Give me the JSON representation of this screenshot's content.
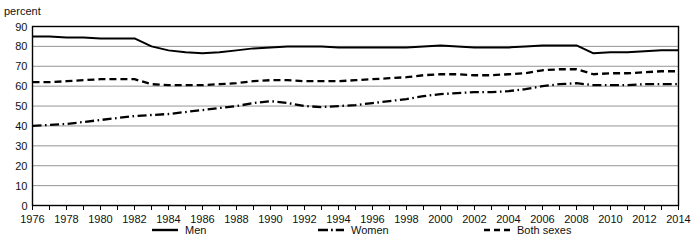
{
  "axis_unit": "percent",
  "legend": {
    "items": [
      {
        "label": "Men",
        "style": "solid"
      },
      {
        "label": "Women",
        "style": "dash-dot"
      },
      {
        "label": "Both sexes",
        "style": "dashed"
      }
    ]
  },
  "chart_data": {
    "type": "line",
    "title": "",
    "subtitle": "",
    "xlabel": "",
    "ylabel": "percent",
    "ylim": [
      0,
      90
    ],
    "xlim": [
      1976,
      2014
    ],
    "ytick_step": 10,
    "yticks": [
      0,
      10,
      20,
      30,
      40,
      50,
      60,
      70,
      80,
      90
    ],
    "xticks": [
      1976,
      1977,
      1978,
      1979,
      1980,
      1981,
      1982,
      1983,
      1984,
      1985,
      1986,
      1987,
      1988,
      1989,
      1990,
      1991,
      1992,
      1993,
      1994,
      1995,
      1996,
      1997,
      1998,
      1999,
      2000,
      2001,
      2002,
      2003,
      2004,
      2005,
      2006,
      2007,
      2008,
      2009,
      2010,
      2011,
      2012,
      2013,
      2014
    ],
    "xtick_labels_shown": [
      1976,
      1978,
      1980,
      1982,
      1984,
      1986,
      1988,
      1990,
      1992,
      1994,
      1996,
      1998,
      2000,
      2002,
      2004,
      2006,
      2008,
      2010,
      2012,
      2014
    ],
    "grid": true,
    "grid_axis": "y",
    "legend_position": "bottom",
    "x": [
      1976,
      1977,
      1978,
      1979,
      1980,
      1981,
      1982,
      1983,
      1984,
      1985,
      1986,
      1987,
      1988,
      1989,
      1990,
      1991,
      1992,
      1993,
      1994,
      1995,
      1996,
      1997,
      1998,
      1999,
      2000,
      2001,
      2002,
      2003,
      2004,
      2005,
      2006,
      2007,
      2008,
      2009,
      2010,
      2011,
      2012,
      2013,
      2014
    ],
    "series": [
      {
        "name": "Men",
        "style": "solid",
        "values": [
          85,
          85,
          84.5,
          84.5,
          84,
          84,
          84,
          80,
          78,
          77,
          76.5,
          77,
          78,
          79,
          79.5,
          80,
          80,
          80,
          79.5,
          79.5,
          79.5,
          79.5,
          79.5,
          80,
          80.5,
          80,
          79.5,
          79.5,
          79.5,
          80,
          80.5,
          80.5,
          80.5,
          76.5,
          77,
          77,
          77.5,
          78,
          78
        ]
      },
      {
        "name": "Women",
        "style": "dash-dot",
        "values": [
          40,
          40.5,
          41,
          42,
          43,
          44,
          45,
          45.5,
          46,
          47,
          48,
          49,
          50,
          51.5,
          52.5,
          51.5,
          50,
          49.5,
          50,
          50.5,
          51.5,
          52.5,
          53.5,
          55,
          56,
          56.5,
          57,
          57,
          57.5,
          58.5,
          60,
          61,
          61.5,
          60.5,
          60.5,
          60.5,
          61,
          61,
          61
        ]
      },
      {
        "name": "Both sexes",
        "style": "dashed",
        "values": [
          62,
          62,
          62.5,
          63,
          63.5,
          63.5,
          63.5,
          61,
          60.5,
          60.5,
          60.5,
          61,
          61.5,
          62.5,
          63,
          63,
          62.5,
          62.5,
          62.5,
          63,
          63.5,
          64,
          64.5,
          65.5,
          66,
          66,
          65.5,
          65.5,
          66,
          66.5,
          68,
          68.5,
          68.5,
          66,
          66.5,
          66.5,
          67,
          67.5,
          67.5
        ]
      }
    ]
  }
}
